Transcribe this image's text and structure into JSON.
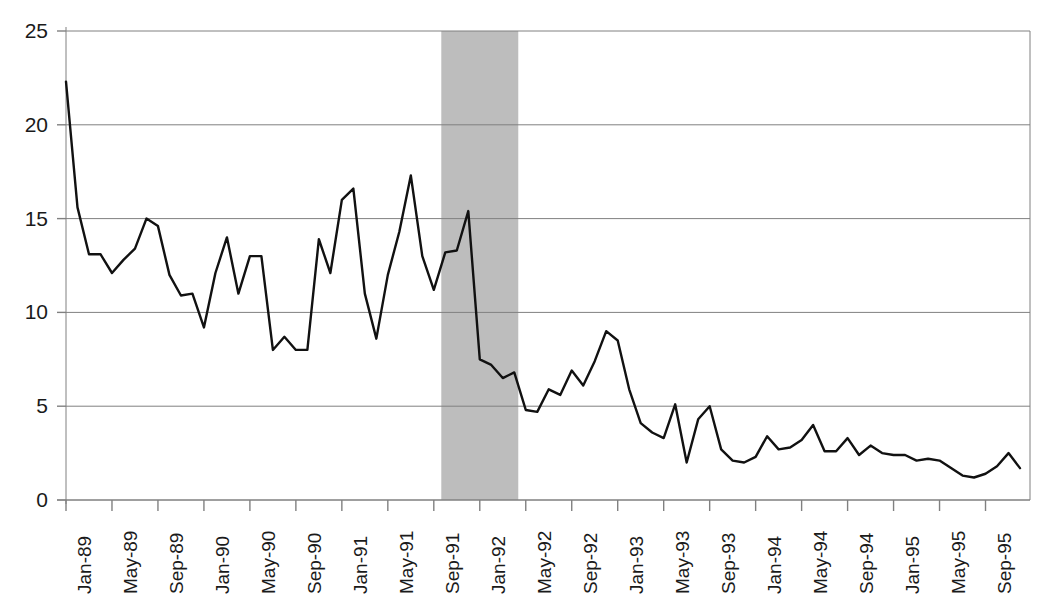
{
  "chart_data": {
    "type": "line",
    "title": "",
    "subtitle": "",
    "xlabel": "",
    "ylabel": "",
    "ylim": [
      0,
      25
    ],
    "ytick_values": [
      0,
      5,
      10,
      15,
      20,
      25
    ],
    "ytick_labels": [
      "0",
      "5",
      "10",
      "15",
      "20",
      "25"
    ],
    "grid": "horizontal",
    "legend": "none",
    "x_start_label": "Jan-89",
    "x_end_label": "Dec-95",
    "x_tick_step_months": 4,
    "xtick_labels": [
      "Jan-89",
      "May-89",
      "Sep-89",
      "Jan-90",
      "May-90",
      "Sep-90",
      "Jan-91",
      "May-91",
      "Sep-91",
      "Jan-92",
      "May-92",
      "Sep-92",
      "Jan-93",
      "May-93",
      "Sep-93",
      "Jan-94",
      "May-94",
      "Sep-94",
      "Jan-95",
      "May-95",
      "Sep-95"
    ],
    "x": [
      "Jan-89",
      "Feb-89",
      "Mar-89",
      "Apr-89",
      "May-89",
      "Jun-89",
      "Jul-89",
      "Aug-89",
      "Sep-89",
      "Oct-89",
      "Nov-89",
      "Dec-89",
      "Jan-90",
      "Feb-90",
      "Mar-90",
      "Apr-90",
      "May-90",
      "Jun-90",
      "Jul-90",
      "Aug-90",
      "Sep-90",
      "Oct-90",
      "Nov-90",
      "Dec-90",
      "Jan-91",
      "Feb-91",
      "Mar-91",
      "Apr-91",
      "May-91",
      "Jun-91",
      "Jul-91",
      "Aug-91",
      "Sep-91",
      "Oct-91",
      "Nov-91",
      "Dec-91",
      "Jan-92",
      "Feb-92",
      "Mar-92",
      "Apr-92",
      "May-92",
      "Jun-92",
      "Jul-92",
      "Aug-92",
      "Sep-92",
      "Oct-92",
      "Nov-92",
      "Dec-92",
      "Jan-93",
      "Feb-93",
      "Mar-93",
      "Apr-93",
      "May-93",
      "Jun-93",
      "Jul-93",
      "Aug-93",
      "Sep-93",
      "Oct-93",
      "Nov-93",
      "Dec-93",
      "Jan-94",
      "Feb-94",
      "Mar-94",
      "Apr-94",
      "May-94",
      "Jun-94",
      "Jul-94",
      "Aug-94",
      "Sep-94",
      "Oct-94",
      "Nov-94",
      "Dec-94",
      "Jan-95",
      "Feb-95",
      "Mar-95",
      "Apr-95",
      "May-95",
      "Jun-95",
      "Jul-95",
      "Aug-95",
      "Sep-95",
      "Oct-95",
      "Nov-95",
      "Dec-95"
    ],
    "values": [
      22.3,
      15.6,
      13.1,
      13.1,
      12.1,
      12.8,
      13.4,
      15.0,
      14.6,
      12.0,
      10.9,
      11.0,
      9.2,
      12.1,
      14.0,
      11.0,
      13.0,
      13.0,
      8.0,
      8.7,
      8.0,
      8.0,
      13.9,
      12.1,
      16.0,
      16.6,
      11.0,
      8.6,
      12.0,
      14.3,
      17.3,
      13.0,
      11.2,
      13.2,
      13.3,
      15.4,
      7.5,
      7.2,
      6.5,
      6.8,
      4.8,
      4.7,
      5.9,
      5.6,
      6.9,
      6.1,
      7.4,
      9.0,
      8.5,
      5.9,
      4.1,
      3.6,
      3.3,
      5.1,
      2.0,
      4.3,
      5.0,
      2.7,
      2.1,
      2.0,
      2.3,
      3.4,
      2.7,
      2.8,
      3.2,
      4.0,
      2.6,
      2.6,
      3.3,
      2.4,
      2.9,
      2.5,
      2.4,
      2.4,
      2.1,
      2.2,
      2.1,
      1.7,
      1.3,
      1.2,
      1.4,
      1.8,
      2.5,
      1.7
    ],
    "shaded_region": {
      "label": "",
      "start": "Oct-91",
      "end": "Apr-92",
      "color": "#b9b9b9"
    },
    "line_color": "#111111",
    "axis_color": "#808080",
    "grid_color": "#808080"
  }
}
